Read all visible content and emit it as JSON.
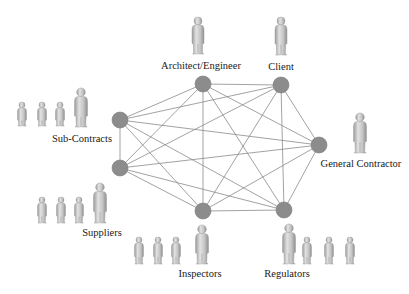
{
  "diagram": {
    "edge_color": "#8a8a8a",
    "node_color": "#8c8c8c",
    "figure_color": "#c8c8c8",
    "node_radius": 8,
    "nodes": [
      {
        "id": "architect",
        "label": "Architect/Engineer",
        "x": 203,
        "y": 84,
        "label_pos": {
          "x": 201,
          "y": 69
        },
        "figures": [
          {
            "x": 198,
            "top": 17,
            "h": 37,
            "w": 12
          }
        ]
      },
      {
        "id": "client",
        "label": "Client",
        "x": 281,
        "y": 85,
        "label_pos": {
          "x": 281,
          "y": 70
        },
        "figures": [
          {
            "x": 281,
            "top": 17,
            "h": 38,
            "w": 12
          }
        ]
      },
      {
        "id": "general-contractor",
        "label": "General Contractor",
        "x": 319,
        "y": 145,
        "label_pos": {
          "x": 361,
          "y": 167
        },
        "figures": [
          {
            "x": 360,
            "top": 113,
            "h": 40,
            "w": 13
          }
        ]
      },
      {
        "id": "regulators",
        "label": "Regulators",
        "x": 284,
        "y": 210,
        "label_pos": {
          "x": 287,
          "y": 277
        },
        "figures": [
          {
            "x": 289,
            "top": 224,
            "h": 40,
            "w": 13
          },
          {
            "x": 307,
            "top": 237,
            "h": 27,
            "w": 9
          },
          {
            "x": 329,
            "top": 237,
            "h": 27,
            "w": 9
          },
          {
            "x": 350,
            "top": 237,
            "h": 27,
            "w": 9
          }
        ]
      },
      {
        "id": "inspectors",
        "label": "Inspectors",
        "x": 203,
        "y": 211,
        "label_pos": {
          "x": 200,
          "y": 277
        },
        "figures": [
          {
            "x": 139,
            "top": 237,
            "h": 27,
            "w": 9
          },
          {
            "x": 158,
            "top": 237,
            "h": 27,
            "w": 9
          },
          {
            "x": 176,
            "top": 237,
            "h": 27,
            "w": 9
          },
          {
            "x": 202,
            "top": 225,
            "h": 39,
            "w": 13
          }
        ]
      },
      {
        "id": "suppliers",
        "label": "Suppliers",
        "x": 120,
        "y": 168,
        "label_pos": {
          "x": 102,
          "y": 236
        },
        "figures": [
          {
            "x": 42,
            "top": 197,
            "h": 26,
            "w": 9
          },
          {
            "x": 61,
            "top": 197,
            "h": 26,
            "w": 9
          },
          {
            "x": 79,
            "top": 197,
            "h": 26,
            "w": 9
          },
          {
            "x": 100,
            "top": 183,
            "h": 40,
            "w": 13
          }
        ]
      },
      {
        "id": "sub-contracts",
        "label": "Sub-Contracts",
        "x": 120,
        "y": 120,
        "label_pos": {
          "x": 82,
          "y": 142
        },
        "figures": [
          {
            "x": 22,
            "top": 102,
            "h": 24,
            "w": 9
          },
          {
            "x": 42,
            "top": 102,
            "h": 24,
            "w": 9
          },
          {
            "x": 60,
            "top": 102,
            "h": 24,
            "w": 9
          },
          {
            "x": 81,
            "top": 88,
            "h": 39,
            "w": 13
          }
        ]
      }
    ],
    "edges": "complete-graph"
  }
}
